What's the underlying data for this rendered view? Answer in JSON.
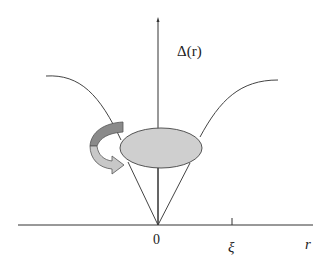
{
  "figure": {
    "labels": {
      "y_axis": "Δ(r)",
      "origin": "0",
      "tick_xi": "ξ",
      "x_axis": "r"
    },
    "colors": {
      "background": "#ffffff",
      "axis": "#333333",
      "curve": "#444444",
      "ellipse_fill": "#cfcfcf",
      "ellipse_stroke": "#555555",
      "arrow_dark": "#8a8a8a",
      "arrow_light": "#c8c8c8"
    },
    "elements": [
      "vertical axis with arrowhead",
      "horizontal r axis",
      "tick at xi",
      "gap function curve Δ(r) dipping to zero at r=0",
      "gray ellipse (vortex core) centered on axis",
      "cone lines from origin to ellipse",
      "curved rotation arrow left of ellipse"
    ]
  }
}
